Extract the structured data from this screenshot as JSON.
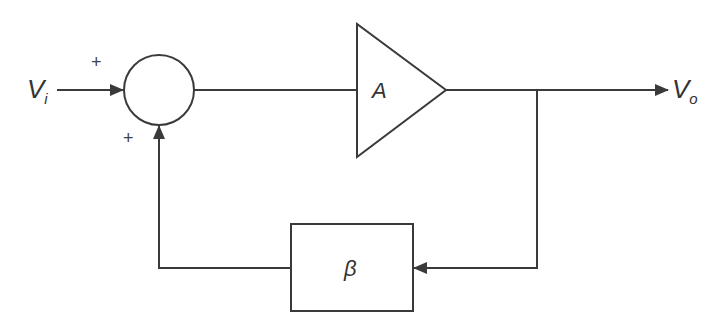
{
  "diagram": {
    "type": "feedback-amplifier-block-diagram",
    "input": {
      "symbol": "V",
      "subscript": "i"
    },
    "output": {
      "symbol": "V",
      "subscript": "o"
    },
    "summing_junction": {
      "input_sign": "+",
      "feedback_sign": "+"
    },
    "amplifier": {
      "label": "A"
    },
    "feedback_block": {
      "label": "β"
    },
    "colors": {
      "stroke": "#3a3a3a",
      "background": "#ffffff"
    }
  }
}
